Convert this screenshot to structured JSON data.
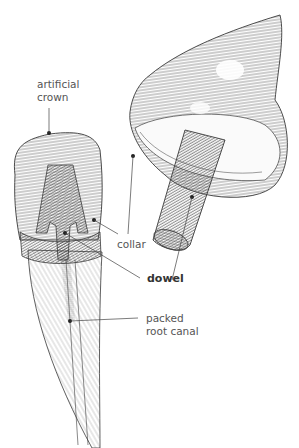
{
  "diagram": {
    "type": "anatomical-illustration",
    "top_clipped_text": "",
    "labels": {
      "artificial_crown_line1": "artificial",
      "artificial_crown_line2": "crown",
      "collar": "collar",
      "dowel": "dowel",
      "packed_root_canal_line1": "packed",
      "packed_root_canal_line2": "root canal"
    },
    "colors": {
      "line": "#3a3a3a",
      "hatch": "#6a6a6a",
      "label_text": "#555555",
      "bold_text": "#333333",
      "background": "#ffffff"
    }
  }
}
